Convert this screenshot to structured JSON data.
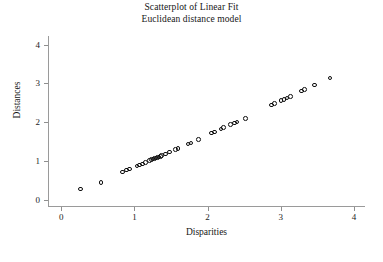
{
  "chart_data": {
    "type": "scatter",
    "title": "Scatterplot of Linear Fit",
    "subtitle": "Euclidean distance model",
    "xlabel": "Disparities",
    "ylabel": "Distances",
    "xlim": [
      -0.18,
      4.15
    ],
    "ylim": [
      -0.18,
      4.22
    ],
    "xticks": [
      0,
      1,
      2,
      3,
      4
    ],
    "yticks": [
      0,
      1,
      2,
      3,
      4
    ],
    "xticklabels": [
      "0",
      "1",
      "2",
      "3",
      "4"
    ],
    "yticklabels": [
      "0",
      "1",
      "2",
      "3",
      "4"
    ],
    "grid": false,
    "legend": null,
    "marker": "open-circle",
    "series": [
      {
        "name": "points",
        "x": [
          0.25,
          0.53,
          0.82,
          0.88,
          0.92,
          1.02,
          1.06,
          1.1,
          1.14,
          1.19,
          1.22,
          1.24,
          1.26,
          1.28,
          1.3,
          1.32,
          1.34,
          1.36,
          1.41,
          1.47,
          1.55,
          1.58,
          1.72,
          1.76,
          1.86,
          2.04,
          2.08,
          2.17,
          2.2,
          2.3,
          2.35,
          2.39,
          2.5,
          2.86,
          2.9,
          2.99,
          3.03,
          3.07,
          3.12,
          3.27,
          3.31,
          3.45,
          3.66
        ],
        "y": [
          0.28,
          0.45,
          0.72,
          0.77,
          0.8,
          0.88,
          0.9,
          0.93,
          0.96,
          1.02,
          1.04,
          1.05,
          1.07,
          1.08,
          1.09,
          1.11,
          1.12,
          1.14,
          1.18,
          1.24,
          1.3,
          1.32,
          1.44,
          1.47,
          1.55,
          1.72,
          1.75,
          1.83,
          1.86,
          1.94,
          1.98,
          2.01,
          2.1,
          2.44,
          2.48,
          2.56,
          2.59,
          2.62,
          2.66,
          2.8,
          2.84,
          2.96,
          3.14
        ],
        "n_points": 43,
        "note": "several markers overlap in pairs near x=0.85-1.40 and x=2.0-2.5"
      }
    ]
  }
}
